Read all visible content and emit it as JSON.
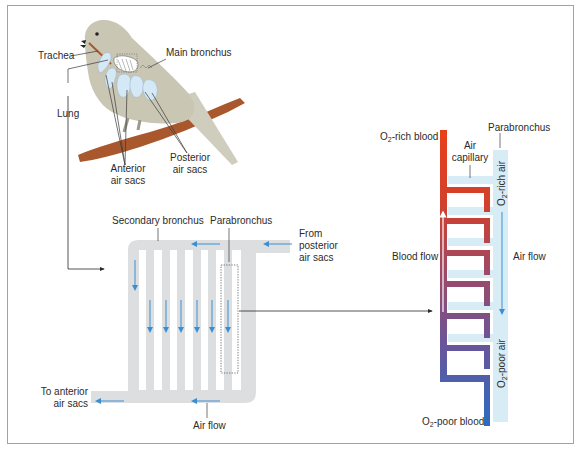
{
  "bird_panel": {
    "labels": {
      "trachea": "Trachea",
      "main_bronchus": "Main bronchus",
      "lung": "Lung",
      "anterior_air_sacs_line1": "Anterior",
      "anterior_air_sacs_line2": "air sacs",
      "posterior_air_sacs_line1": "Posterior",
      "posterior_air_sacs_line2": "air sacs"
    }
  },
  "lung_schematic": {
    "labels": {
      "secondary_bronchus": "Secondary bronchus",
      "parabronchus": "Parabronchus",
      "from_posterior_line1": "From",
      "from_posterior_line2": "posterior",
      "from_posterior_line3": "air sacs",
      "to_anterior_line1": "To anterior",
      "to_anterior_line2": "air sacs",
      "air_flow": "Air flow"
    },
    "parabronchi_count": 6
  },
  "gas_exchange_panel": {
    "labels": {
      "o2_rich_blood_prefix": "O",
      "o2_rich_blood_sub": "2",
      "o2_rich_blood_suffix": "-rich blood",
      "o2_poor_blood_prefix": "O",
      "o2_poor_blood_sub": "2",
      "o2_poor_blood_suffix": "-poor blood",
      "parabronchus": "Parabronchus",
      "air_capillary_line1": "Air",
      "air_capillary_line2": "capillary",
      "blood_flow": "Blood flow",
      "air_flow": "Air flow",
      "o2_rich_air_prefix": "O",
      "o2_rich_air_sub": "2",
      "o2_rich_air_suffix": "-rich air",
      "o2_poor_air_prefix": "O",
      "o2_poor_air_sub": "2",
      "o2_poor_air_suffix": "-poor air"
    },
    "capillary_loops": 6
  },
  "colors": {
    "frame": "#9aa3b0",
    "air_duct_grey": "#dcdedf",
    "air_arrow_blue": "#3a8fd4",
    "air_sac_blue": "#d4e8f5",
    "parabronchus_light_blue": "#d8ecf6",
    "blood_oxygen_rich": "#e8401c",
    "blood_oxygen_poor": "#2a6cc0",
    "bird_body": "#c9c6b4",
    "perch": "#a9582e",
    "leader_line": "#3a3a3a"
  }
}
